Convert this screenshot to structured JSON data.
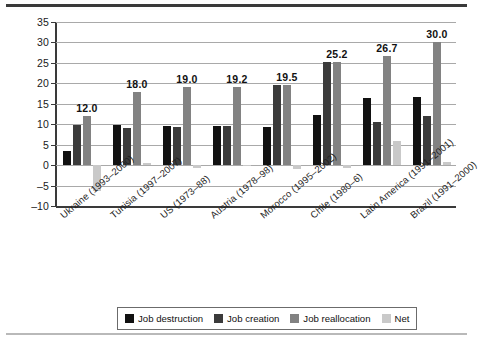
{
  "chart_data": {
    "type": "bar",
    "title": "",
    "xlabel": "",
    "ylabel": "",
    "ylim": [
      -10,
      35
    ],
    "yticks": [
      35,
      30,
      25,
      20,
      15,
      10,
      5,
      0,
      -5,
      -10
    ],
    "grid": true,
    "legend_position": "bottom",
    "categories": [
      "Ukraine (1993–2000)",
      "Tunisia (1997–2007)",
      "US (1973–88)",
      "Austria (1978–98)",
      "Morocco (1995–2002)",
      "Chile (1980–6)",
      "Latin America (1991–2001)",
      "Brazil (1991–2000)"
    ],
    "series": [
      {
        "name": "Job destruction",
        "color": "#111111",
        "values": [
          3.4,
          9.8,
          9.6,
          9.6,
          9.3,
          12.2,
          16.5,
          16.6
        ]
      },
      {
        "name": "Job creation",
        "color": "#3b3b3b",
        "values": [
          9.8,
          9.1,
          9.4,
          9.6,
          19.5,
          25.2,
          10.6,
          12.1
        ]
      },
      {
        "name": "Job reallocation",
        "color": "#828282",
        "values": [
          12.0,
          18.0,
          19.0,
          19.2,
          19.5,
          25.2,
          26.7,
          30.0
        ]
      },
      {
        "name": "Net",
        "color": "#c9c9c9",
        "values": [
          -6.4,
          0.5,
          -0.6,
          0.0,
          -0.9,
          -0.8,
          6.0,
          0.8
        ]
      }
    ],
    "reallocation_labels": [
      "12.0",
      "18.0",
      "19.0",
      "19.2",
      "19.5",
      "25.2",
      "26.7",
      "30.0"
    ]
  },
  "legend": {
    "items": [
      {
        "label": "Job destruction",
        "color": "#111111"
      },
      {
        "label": "Job creation",
        "color": "#3b3b3b"
      },
      {
        "label": "Job reallocation",
        "color": "#828282"
      },
      {
        "label": "Net",
        "color": "#c9c9c9"
      }
    ]
  }
}
